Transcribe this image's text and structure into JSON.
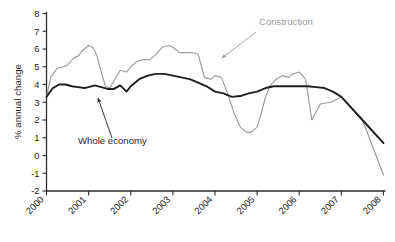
{
  "chart_data": {
    "type": "line",
    "title": "",
    "xlabel": "",
    "ylabel": "% annual change",
    "xlim": [
      2000,
      2008
    ],
    "ylim": [
      -2,
      8
    ],
    "yticks": [
      8,
      7,
      6,
      5,
      4,
      3,
      2,
      1,
      0,
      -1,
      -2
    ],
    "ytick_labels": [
      "8",
      "7",
      "6",
      "5",
      "4",
      "3",
      "2",
      "1",
      "0",
      "-1",
      "-2"
    ],
    "xticks": [
      2000,
      2001,
      2002,
      2003,
      2004,
      2005,
      2006,
      2007,
      2008
    ],
    "xtick_labels": [
      "2000",
      "2001",
      "2002",
      "2003",
      "2004",
      "2005",
      "2006",
      "2007",
      "2008"
    ],
    "grid": false,
    "legend_position": "annotations",
    "series": [
      {
        "name": "Construction",
        "color": "#9a9a9a",
        "x": [
          2000.0,
          2000.1,
          2000.25,
          2000.4,
          2000.5,
          2000.65,
          2000.75,
          2000.85,
          2001.0,
          2001.1,
          2001.2,
          2001.3,
          2001.4,
          2001.5,
          2001.6,
          2001.75,
          2001.9,
          2002.0,
          2002.15,
          2002.3,
          2002.45,
          2002.6,
          2002.75,
          2002.9,
          2003.0,
          2003.15,
          2003.3,
          2003.45,
          2003.6,
          2003.75,
          2003.9,
          2004.0,
          2004.15,
          2004.3,
          2004.45,
          2004.6,
          2004.75,
          2004.85,
          2005.0,
          2005.1,
          2005.2,
          2005.3,
          2005.45,
          2005.6,
          2005.75,
          2005.85,
          2006.0,
          2006.15,
          2006.3,
          2006.5,
          2006.75,
          2007.0,
          2007.5,
          2008.0
        ],
        "y": [
          3.3,
          4.4,
          4.9,
          5.0,
          5.1,
          5.5,
          5.6,
          5.9,
          6.2,
          6.1,
          5.6,
          4.7,
          3.9,
          3.8,
          4.2,
          4.8,
          4.7,
          5.0,
          5.3,
          5.4,
          5.4,
          5.7,
          6.1,
          6.2,
          6.1,
          5.8,
          5.8,
          5.8,
          5.7,
          4.4,
          4.3,
          4.5,
          4.4,
          3.5,
          2.4,
          1.6,
          1.3,
          1.3,
          1.6,
          2.4,
          3.3,
          3.9,
          4.3,
          4.5,
          4.4,
          4.6,
          4.7,
          4.3,
          2.0,
          2.9,
          3.0,
          3.3,
          2.0,
          -1.1
        ]
      },
      {
        "name": "Whole economy",
        "color": "#1f1f1f",
        "x": [
          2000.0,
          2000.15,
          2000.3,
          2000.45,
          2000.6,
          2000.75,
          2000.9,
          2001.0,
          2001.15,
          2001.3,
          2001.45,
          2001.6,
          2001.75,
          2001.9,
          2002.0,
          2002.2,
          2002.4,
          2002.6,
          2002.8,
          2003.0,
          2003.2,
          2003.4,
          2003.6,
          2003.8,
          2004.0,
          2004.2,
          2004.4,
          2004.6,
          2004.8,
          2005.0,
          2005.2,
          2005.4,
          2005.6,
          2005.8,
          2006.0,
          2006.2,
          2006.4,
          2006.6,
          2006.8,
          2007.0,
          2007.5,
          2008.0
        ],
        "y": [
          3.3,
          3.8,
          4.0,
          4.0,
          3.9,
          3.85,
          3.8,
          3.85,
          3.95,
          3.85,
          3.75,
          3.75,
          3.95,
          3.6,
          3.9,
          4.3,
          4.5,
          4.6,
          4.6,
          4.5,
          4.4,
          4.3,
          4.1,
          3.9,
          3.6,
          3.5,
          3.3,
          3.35,
          3.5,
          3.6,
          3.8,
          3.9,
          3.9,
          3.9,
          3.9,
          3.9,
          3.85,
          3.8,
          3.6,
          3.3,
          2.0,
          0.7
        ]
      }
    ],
    "annotations": [
      {
        "id": "construction-annotation",
        "text": "Construction",
        "color": "#9a9a9a",
        "label_x": 259,
        "label_y": 25,
        "arrow_from_x": 256,
        "arrow_from_y": 32,
        "arrow_to_x": 222,
        "arrow_to_y": 58
      },
      {
        "id": "whole-economy-annotation",
        "text": "Whole economy",
        "color": "#1f1f1f",
        "label_x": 78,
        "label_y": 144,
        "arrow_from_x": 112,
        "arrow_from_y": 138,
        "arrow_to_x": 98,
        "arrow_to_y": 98
      }
    ]
  },
  "axis": {
    "y_label": "% annual change"
  }
}
